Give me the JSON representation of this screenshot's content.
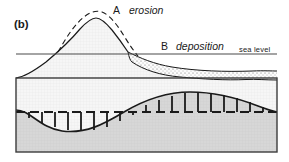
{
  "figure": {
    "panel_label": "(b)",
    "annotations": {
      "a_key": "A",
      "a_term": "erosion",
      "b_key": "B",
      "b_term": "deposition",
      "sea_level": "sea level"
    },
    "colors": {
      "line": "#1a1a1a",
      "sea_level_line": "#4a4a4a",
      "upper_unit_fill": "#f7f7f7",
      "sediment_fill": "#fbfbfb",
      "basement_fill": "#d8d8d8",
      "frame": "#3c3c3c",
      "text": "#1a1a1a"
    },
    "geometry": {
      "frame": {
        "x": 16,
        "y": 78,
        "width": 261,
        "height": 74
      },
      "sea_level_y": 54,
      "unconformity_dashed_y": 112,
      "tick_count": 19
    },
    "elements": {
      "original_profile": "dashed pre-erosion mountain profile",
      "eroded_profile": "solid post-erosion mountain profile",
      "sediment_wedge": "stippled deposited sediment layer below sea level",
      "unconformity": "sinusoidal unconformity surface with tick marks",
      "basement": "grey basement rock unit"
    }
  }
}
